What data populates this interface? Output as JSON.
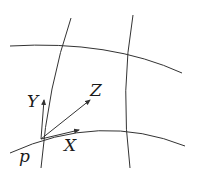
{
  "diagram": {
    "colors": {
      "line": "#333333",
      "text": "#1a1a1a",
      "background": "#ffffff"
    },
    "labels": {
      "point": "p",
      "vector_x": "X",
      "vector_y": "Y",
      "vector_z": "Z"
    },
    "curves": [
      {
        "id": "left-vertical",
        "type": "coordinate-curve"
      },
      {
        "id": "right-vertical",
        "type": "coordinate-curve"
      },
      {
        "id": "top-horizontal",
        "type": "coordinate-curve"
      },
      {
        "id": "bottom-horizontal",
        "type": "coordinate-curve"
      }
    ],
    "vectors": [
      {
        "name": "X",
        "from": "p",
        "direction": "along bottom-horizontal curve"
      },
      {
        "name": "Y",
        "from": "p",
        "direction": "along left-vertical curve"
      },
      {
        "name": "Z",
        "from": "p",
        "direction": "diagonal"
      }
    ]
  }
}
